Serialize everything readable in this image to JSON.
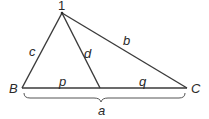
{
  "diagram": {
    "type": "triangle-with-cevian",
    "stroke_color": "#3a3a3a",
    "vertices": {
      "apex": {
        "label": "1",
        "x": 62,
        "y": 13
      },
      "B": {
        "label": "B",
        "x": 22,
        "y": 88
      },
      "C": {
        "label": "C",
        "x": 187,
        "y": 88
      },
      "D": {
        "label": "",
        "x": 100,
        "y": 88
      }
    },
    "sides": {
      "c": {
        "label": "c",
        "x": 33,
        "y": 56
      },
      "b": {
        "label": "b",
        "x": 126,
        "y": 45
      },
      "d": {
        "label": "d",
        "x": 87,
        "y": 57
      },
      "p": {
        "label": "p",
        "x": 61,
        "y": 86
      },
      "q": {
        "label": "q",
        "x": 142,
        "y": 86
      },
      "a": {
        "label": "a",
        "x": 100,
        "y": 114
      }
    }
  }
}
